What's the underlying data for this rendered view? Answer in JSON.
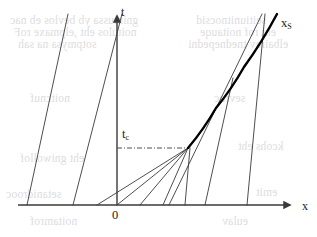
{
  "figure": {
    "kind": "characteristics-diagram",
    "background_color": "#ffffff",
    "line_color": "#3a3a3a",
    "shock_color": "#000000",
    "ghost_text_color": "#d7d7db",
    "width": 317,
    "height": 237
  },
  "labels": {
    "t_axis": "t",
    "x_axis": "x",
    "origin": "0",
    "shock_curve": "x",
    "shock_curve_sub": "S",
    "critical_time": "t",
    "critical_time_sub": "c"
  },
  "ghost_text": {
    "lines": [
      {
        "text": "gnimussa yb bevlos eb nac",
        "left": 10,
        "top": 14
      },
      {
        "text": "noitulos eht ,elpmaxe roF",
        "left": 14,
        "top": 26
      },
      {
        "text": "sotpmysa na sah",
        "left": 18,
        "top": 38
      },
      {
        "text": "seitiunitnocsid",
        "left": 196,
        "top": 14
      },
      {
        "text": "eht rof noitauqe",
        "left": 200,
        "top": 26
      },
      {
        "text": "elbairav tnednepedni",
        "left": 188,
        "top": 38
      },
      {
        "text": "noitcnuf",
        "left": 30,
        "top": 92
      },
      {
        "text": "sevruc",
        "left": 214,
        "top": 92
      },
      {
        "text": "eht gniwollof",
        "left": 20,
        "top": 152
      },
      {
        "text": "kcohs eht",
        "left": 238,
        "top": 140
      },
      {
        "text": "setanidrooc",
        "left": 6,
        "top": 188
      },
      {
        "text": "emit",
        "left": 256,
        "top": 186
      },
      {
        "text": "noitamrof",
        "left": 30,
        "top": 215
      },
      {
        "text": "eulav",
        "left": 222,
        "top": 215
      }
    ]
  },
  "chart_data": {
    "type": "line",
    "title": "",
    "xlabel": "x",
    "ylabel": "t",
    "grid": false,
    "legend": null,
    "axes": {
      "origin_px": {
        "x": 117,
        "y": 205
      },
      "x_axis": {
        "x_start_px": 18,
        "x_end_px": 296,
        "y_px": 205,
        "arrow": "right"
      },
      "t_axis": {
        "y_start_px": 205,
        "y_end_px": 10,
        "x_px": 117,
        "arrow": "up"
      }
    },
    "annotations": [
      {
        "name": "critical-time-marker",
        "label": "t_c",
        "style": "dash-dot",
        "from_px": {
          "x": 117,
          "y": 148
        },
        "to_px": {
          "x": 188,
          "y": 148
        }
      }
    ],
    "characteristics": [
      {
        "name": "characteristic-1",
        "x0_px": 27,
        "y0_px": 205,
        "x1_px": 68,
        "y1_px": 14
      },
      {
        "name": "characteristic-2",
        "x0_px": 73,
        "y0_px": 205,
        "x1_px": 122,
        "y1_px": 14
      },
      {
        "name": "characteristic-3",
        "x0_px": 97,
        "y0_px": 205,
        "x1_px": 188,
        "y1_px": 148
      },
      {
        "name": "characteristic-4",
        "x0_px": 117,
        "y0_px": 205,
        "x1_px": 188,
        "y1_px": 148
      },
      {
        "name": "characteristic-5",
        "x0_px": 140,
        "y0_px": 205,
        "x1_px": 188,
        "y1_px": 148
      },
      {
        "name": "characteristic-6",
        "x0_px": 163,
        "y0_px": 205,
        "x1_px": 188,
        "y1_px": 148
      },
      {
        "name": "characteristic-7",
        "x0_px": 185,
        "y0_px": 205,
        "x1_px": 190,
        "y1_px": 148
      },
      {
        "name": "characteristic-8",
        "x0_px": 205,
        "y0_px": 205,
        "x1_px": 233,
        "y1_px": 78
      },
      {
        "name": "characteristic-9",
        "x0_px": 247,
        "y0_px": 205,
        "x1_px": 265,
        "y1_px": 14
      },
      {
        "name": "characteristic-10",
        "x0_px": 169,
        "y0_px": 205,
        "x1_px": 262,
        "y1_px": 14
      }
    ],
    "shock_curve": {
      "name": "shock-trajectory",
      "label": "x_S",
      "thick": true,
      "points_px": [
        {
          "x": 188,
          "y": 148
        },
        {
          "x": 216,
          "y": 108
        },
        {
          "x": 244,
          "y": 67
        },
        {
          "x": 277,
          "y": 14
        }
      ]
    }
  }
}
